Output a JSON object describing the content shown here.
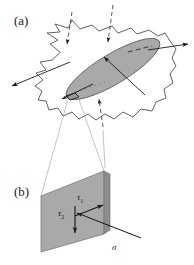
{
  "figure": {
    "title": "",
    "background_color": "#ffffff",
    "width": 194,
    "height": 265
  },
  "colors": {
    "ink": "#1a1a1a",
    "outline": "#3a3a3a",
    "fault_plane_fill": "#a9a9a9",
    "patch_plane_fill": "#a9a9a9",
    "patch_plane_edge": "#8d8d8d",
    "background": "#ffffff",
    "cone_line": "#8a8a8a"
  },
  "panels": [
    {
      "id": "a",
      "label": "(a)",
      "description": "Irregular rock volume outline containing a shaded elliptical fault plane, with inward loading arrows and outward slip arrows.",
      "elements": {
        "body_outline_name": "rock-volume-outline",
        "fault_plane_name": "fault-plane-ellipse",
        "fault_dashed_line_name": "fault-slip-dashed-line",
        "patch_marker_name": "fault-patch-marker",
        "inward_arrows": 3,
        "outward_arrows": 3
      }
    },
    {
      "id": "b",
      "label": "(b)",
      "description": "Magnified fault patch drawn as a tilted plane with two shear traction vectors and one normal stress vector.",
      "elements": {
        "plane_name": "fault-patch-plane",
        "magnification_cone_name": "magnification-cone"
      }
    }
  ],
  "labels": {
    "panel_a": "(a)",
    "panel_b": "(b)",
    "tau": "τ",
    "tau_1_sub": "1",
    "tau_2_sub": "2",
    "sigma": "σ"
  },
  "vectors": [
    {
      "name": "tau-1-vector",
      "symbol": "τ",
      "subscript": "1",
      "meaning": "in-plane shear traction, strike direction",
      "direction": "right-up along plane"
    },
    {
      "name": "tau-2-vector",
      "symbol": "τ",
      "subscript": "2",
      "meaning": "in-plane shear traction, dip direction",
      "direction": "down along plane"
    },
    {
      "name": "sigma-vector",
      "symbol": "σ",
      "subscript": "",
      "meaning": "normal stress, perpendicular to plane",
      "direction": "out of plane toward lower right"
    }
  ]
}
